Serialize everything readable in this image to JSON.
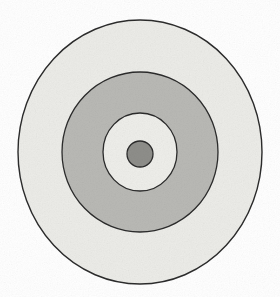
{
  "figure": {
    "background_color": "#ffffff",
    "canvas": {
      "width": 280,
      "height": 297
    },
    "center": {
      "x": 140,
      "y": 152
    },
    "stroke_color": "#2b2b2b",
    "stroke_width": 1.3
  },
  "chart_data": {
    "type": "scatter",
    "xlabel": "",
    "ylabel": "",
    "grid": false,
    "legend": "none",
    "xlim": [
      0,
      280
    ],
    "ylim": [
      0,
      297
    ],
    "rings": [
      {
        "name": "outer-circle",
        "order": 1,
        "cx": 140,
        "cy": 152,
        "rx": 122,
        "ry": 132,
        "fill": "#ecece8",
        "stroke": "#2b2b2b",
        "stroke_width": 1.4,
        "fill_label": "very light gray"
      },
      {
        "name": "middle-ring",
        "order": 2,
        "cx": 140,
        "cy": 152,
        "rx": 78,
        "ry": 80,
        "fill": "#b9b9b5",
        "stroke": "#2b2b2b",
        "stroke_width": 1.3,
        "fill_label": "medium gray"
      },
      {
        "name": "inner-ring",
        "order": 3,
        "cx": 140,
        "cy": 152,
        "rx": 37,
        "ry": 39,
        "fill": "#eeeeea",
        "stroke": "#2b2b2b",
        "stroke_width": 1.3,
        "fill_label": "very light gray"
      },
      {
        "name": "center-dot",
        "order": 4,
        "cx": 140,
        "cy": 154,
        "rx": 13,
        "ry": 13,
        "fill": "#8e8e8a",
        "stroke": "#2b2b2b",
        "stroke_width": 1.3,
        "fill_label": "dark gray"
      }
    ],
    "band_count": 4,
    "shape": "ellipse"
  },
  "labels": {
    "none_visible": ""
  }
}
